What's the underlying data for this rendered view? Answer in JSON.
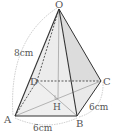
{
  "figure": {
    "type": "square pyramid",
    "vertices": {
      "O": {
        "label": "O",
        "x": 59,
        "y": 9
      },
      "A": {
        "label": "A",
        "x": 15,
        "y": 116
      },
      "B": {
        "label": "B",
        "x": 77,
        "y": 116
      },
      "C": {
        "label": "C",
        "x": 101,
        "y": 81
      },
      "D": {
        "label": "D",
        "x": 37,
        "y": 81
      },
      "H": {
        "label": "H",
        "x": 57,
        "y": 98
      }
    },
    "measurements": {
      "lateral_edge": "8cm",
      "base_side_AB": "6cm",
      "base_side_BC": "6cm"
    },
    "colors": {
      "edge": "#333333",
      "face_fill": "#e6e6e6",
      "hidden": "#333333",
      "dimension_arc": "#aaaaaa"
    }
  }
}
